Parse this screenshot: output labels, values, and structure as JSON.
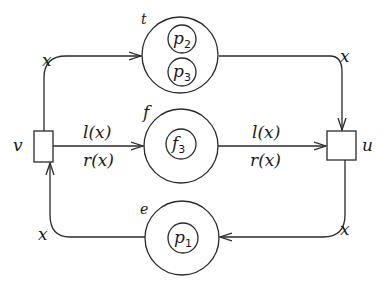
{
  "diagram": {
    "type": "petri-net",
    "transitions": [
      {
        "id": "v",
        "label": "v"
      },
      {
        "id": "u",
        "label": "u"
      }
    ],
    "places": [
      {
        "id": "t",
        "label": "t",
        "tokens": [
          {
            "base": "p",
            "sub": "2"
          },
          {
            "base": "p",
            "sub": "3"
          }
        ]
      },
      {
        "id": "f",
        "label": "f",
        "tokens": [
          {
            "base": "f",
            "sub": "3"
          }
        ]
      },
      {
        "id": "e",
        "label": "e",
        "tokens": [
          {
            "base": "p",
            "sub": "1"
          }
        ]
      }
    ],
    "arcs": [
      {
        "from": "v",
        "to": "t",
        "label": "x"
      },
      {
        "from": "t",
        "to": "u",
        "label": "x"
      },
      {
        "from": "v",
        "to": "f",
        "label_top": "l(x)",
        "label_bottom": "r(x)"
      },
      {
        "from": "f",
        "to": "u",
        "label_top": "l(x)",
        "label_bottom": "r(x)"
      },
      {
        "from": "u",
        "to": "e",
        "label": "x"
      },
      {
        "from": "e",
        "to": "v",
        "label": "x"
      }
    ]
  }
}
